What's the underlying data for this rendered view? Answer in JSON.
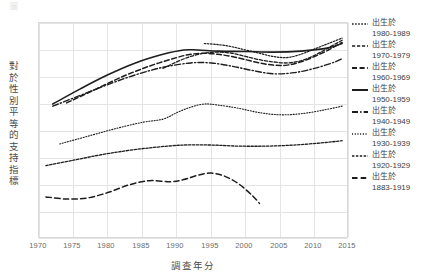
{
  "chart_data": {
    "type": "line",
    "title": "",
    "xlabel": "調查年分",
    "ylabel": "對於性別平等的支持指標",
    "xlim": [
      1970,
      2015
    ],
    "ylim": [
      0,
      100
    ],
    "grid": true,
    "legend_position": "right",
    "xticks": [
      "1970",
      "1975",
      "1980",
      "1985",
      "1990",
      "1995",
      "2000",
      "2005",
      "2010",
      "2015"
    ],
    "yticks": [],
    "series": [
      {
        "name": "出生於 1980-1989",
        "label_top": "出生於",
        "label_years": "1980-1989",
        "style": "dotted-fine",
        "x": [
          1994,
          1996,
          1998,
          2000,
          2002,
          2004,
          2006,
          2008,
          2010,
          2012,
          2014
        ],
        "y": [
          90.5,
          90.0,
          89.0,
          87.5,
          86.0,
          84.5,
          84.0,
          85.5,
          88.0,
          90.5,
          93.0
        ]
      },
      {
        "name": "出生於 1970-1979",
        "label_top": "出生於",
        "label_years": "1970-1979",
        "style": "dashed-short",
        "x": [
          1988,
          1990,
          1992,
          1994,
          1996,
          1998,
          2000,
          2002,
          2004,
          2006,
          2008,
          2010,
          2012,
          2014
        ],
        "y": [
          79.0,
          82.0,
          84.5,
          86.0,
          86.5,
          86.0,
          84.5,
          83.0,
          82.0,
          81.5,
          82.5,
          85.0,
          88.5,
          92.0
        ]
      },
      {
        "name": "出生於 1960-1969",
        "label_top": "出生於",
        "label_years": "1960-1969",
        "style": "dashed-medium",
        "x": [
          1974,
          1978,
          1982,
          1986,
          1990,
          1992,
          1994,
          1996,
          1998,
          2000,
          2002,
          2004,
          2006,
          2008,
          2010,
          2012,
          2014
        ],
        "y": [
          63.0,
          69.0,
          75.0,
          80.0,
          84.0,
          85.5,
          86.0,
          85.5,
          84.5,
          83.0,
          81.5,
          80.5,
          80.5,
          82.0,
          84.5,
          87.5,
          91.0
        ]
      },
      {
        "name": "出生於 1950-1959",
        "label_top": "出生於",
        "label_years": "1950-1959",
        "style": "solid",
        "x": [
          1972,
          1976,
          1980,
          1984,
          1988,
          1991,
          1993,
          1996,
          2000,
          2004,
          2008,
          2012,
          2014
        ],
        "y": [
          62.5,
          69.5,
          76.0,
          81.5,
          85.5,
          87.5,
          87.5,
          87.0,
          86.8,
          86.5,
          87.0,
          88.5,
          90.5
        ]
      },
      {
        "name": "出生於 1940-1949",
        "label_top": "出生於",
        "label_years": "1940-1949",
        "style": "dash-dot",
        "x": [
          1972,
          1976,
          1980,
          1984,
          1988,
          1992,
          1995,
          1998,
          2001,
          2004,
          2007,
          2010,
          2013,
          2014
        ],
        "y": [
          61.5,
          66.5,
          71.5,
          76.0,
          79.5,
          81.5,
          81.5,
          80.0,
          78.0,
          76.5,
          77.0,
          79.0,
          82.0,
          83.5
        ]
      },
      {
        "name": "出生於 1930-1939",
        "label_top": "出生於",
        "label_years": "1930-1939",
        "style": "dotted-sparse",
        "x": [
          1973,
          1977,
          1981,
          1985,
          1988,
          1990,
          1992,
          1994,
          1996,
          1999,
          2002,
          2005,
          2008,
          2011,
          2014
        ],
        "y": [
          44.0,
          47.5,
          51.0,
          54.0,
          55.5,
          58.5,
          61.0,
          62.5,
          62.0,
          60.5,
          58.5,
          57.5,
          58.0,
          59.5,
          61.5
        ]
      },
      {
        "name": "出生於 1920-1929",
        "label_top": "出生於",
        "label_years": "1920-1929",
        "style": "dotted-dashed",
        "x": [
          1971,
          1975,
          1979,
          1983,
          1987,
          1991,
          1995,
          1999,
          2003,
          2007,
          2011,
          2014
        ],
        "y": [
          34.0,
          36.5,
          39.0,
          41.0,
          42.5,
          43.5,
          43.5,
          43.0,
          43.0,
          43.5,
          44.5,
          45.5
        ]
      },
      {
        "name": "出生於 1883-1919",
        "label_top": "出生於",
        "label_years": "1883-1919",
        "style": "dashed-long",
        "x": [
          1971,
          1974,
          1977,
          1980,
          1983,
          1986,
          1989,
          1991,
          1993,
          1995,
          1997,
          1999,
          2001,
          2002
        ],
        "y": [
          19.5,
          18.5,
          19.0,
          21.5,
          25.0,
          27.0,
          26.5,
          27.5,
          29.5,
          30.5,
          29.0,
          25.5,
          20.0,
          16.5
        ]
      }
    ]
  },
  "axis": {
    "xlabel": "調查年分",
    "ylabel": "對於性別平等的支持指標"
  }
}
